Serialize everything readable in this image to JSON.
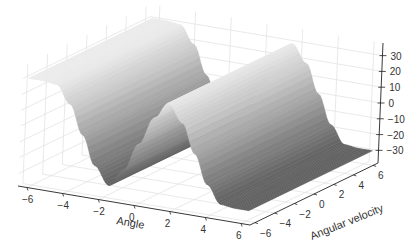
{
  "chart_data": {
    "type": "surface3d",
    "title": "",
    "xlabel": "Angle",
    "ylabel": "Angular velocity",
    "zlabel": "",
    "x_ticks": [
      -6,
      -4,
      -2,
      0,
      2,
      4,
      6
    ],
    "y_ticks": [
      -6,
      -4,
      -2,
      0,
      2,
      4,
      6
    ],
    "z_ticks": [
      30,
      20,
      10,
      0,
      -10,
      -20,
      -30
    ],
    "xlim": [
      -6.5,
      6.5
    ],
    "ylim": [
      -6.5,
      6.5
    ],
    "zlim": [
      -38,
      38
    ],
    "grid": true,
    "colormap": "gray",
    "surface_description": "z depends only on Angle: plateau near +30 for Angle in [-6.3,-4.7], falls to about -30 near Angle -2, rises back to +30 near Angle 0.8, plateau to ~2, falls to -30 near Angle 4.7 and stays low; constant along Angular velocity",
    "profile": {
      "angle": [
        -6.28,
        -5.5,
        -4.7,
        -3.9,
        -3.14,
        -2.4,
        -1.57,
        -0.8,
        0.0,
        0.8,
        1.57,
        2.4,
        3.14,
        3.9,
        4.7,
        5.5,
        6.28
      ],
      "z": [
        30,
        30,
        29,
        18,
        0,
        -18,
        -29,
        -18,
        0,
        18,
        29,
        18,
        0,
        -18,
        -29,
        -30,
        -30
      ]
    },
    "velocity_range": [
      -6.28,
      6.28
    ]
  }
}
